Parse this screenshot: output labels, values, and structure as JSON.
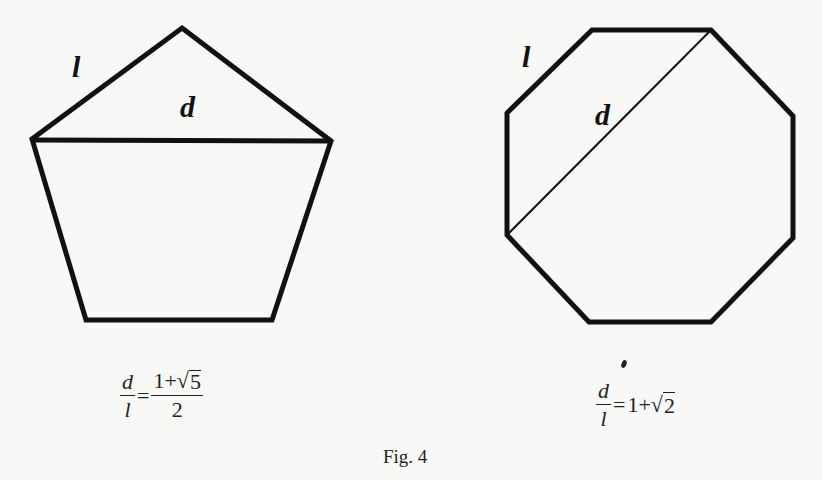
{
  "figure": {
    "caption": "Fig. 4"
  },
  "pentagon": {
    "side_label": "l",
    "diagonal_label": "d",
    "formula": {
      "lhs_num": "d",
      "lhs_den": "l",
      "equals": "=",
      "rhs_num_a": "1+",
      "rhs_radical": "√",
      "rhs_radicand": "5",
      "rhs_den": "2"
    }
  },
  "octagon": {
    "side_label": "l",
    "diagonal_label": "d",
    "formula": {
      "lhs_num": "d",
      "lhs_den": "l",
      "equals": "=",
      "rhs_a": "1+",
      "rhs_radical": "√",
      "rhs_radicand": "2"
    }
  }
}
